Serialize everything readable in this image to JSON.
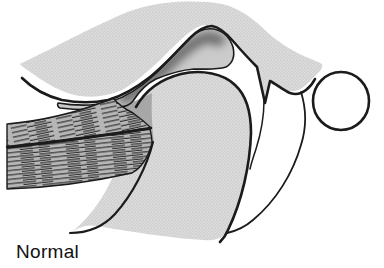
{
  "figure": {
    "caption": "Normal",
    "colors": {
      "background": "#ffffff",
      "outline": "#1b1b1b",
      "bone_base": "#dcdcdc",
      "bone_dot": "#c5c5c5",
      "muscle_base": "#b6b6b6",
      "muscle_fiber": "#303030",
      "muscle_insertion": "#a7a7a7",
      "disc_base": "#cbcbcb",
      "disc_core": "#6d6d6d",
      "ear_canal_fill": "#ffffff",
      "caption_color": "#111111"
    }
  }
}
